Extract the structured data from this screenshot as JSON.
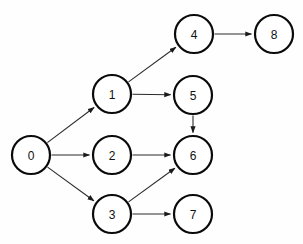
{
  "diagram": {
    "type": "directed-graph",
    "background_color": "#fefefe",
    "node_fill": "#ffffff",
    "node_stroke": "#0a0a0a",
    "edge_color": "#2b2b2b",
    "label_color": "#111111",
    "node_radius": 19,
    "nodes": [
      {
        "id": "0",
        "label": "0",
        "cx": 31,
        "cy": 155
      },
      {
        "id": "1",
        "label": "1",
        "cx": 112,
        "cy": 94
      },
      {
        "id": "2",
        "label": "2",
        "cx": 112,
        "cy": 155
      },
      {
        "id": "3",
        "label": "3",
        "cx": 112,
        "cy": 214
      },
      {
        "id": "4",
        "label": "4",
        "cx": 194,
        "cy": 34
      },
      {
        "id": "5",
        "label": "5",
        "cx": 193,
        "cy": 95
      },
      {
        "id": "6",
        "label": "6",
        "cx": 193,
        "cy": 155
      },
      {
        "id": "7",
        "label": "7",
        "cx": 193,
        "cy": 214
      },
      {
        "id": "8",
        "label": "8",
        "cx": 274,
        "cy": 34
      }
    ],
    "edges": [
      {
        "from": "0",
        "to": "1"
      },
      {
        "from": "0",
        "to": "2"
      },
      {
        "from": "0",
        "to": "3"
      },
      {
        "from": "1",
        "to": "4"
      },
      {
        "from": "1",
        "to": "5"
      },
      {
        "from": "2",
        "to": "6"
      },
      {
        "from": "3",
        "to": "6"
      },
      {
        "from": "3",
        "to": "7"
      },
      {
        "from": "5",
        "to": "6"
      },
      {
        "from": "4",
        "to": "8"
      }
    ]
  }
}
